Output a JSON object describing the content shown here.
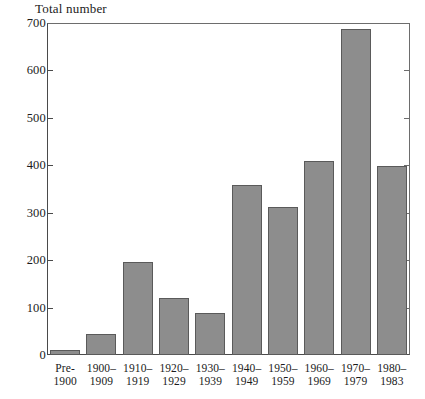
{
  "chart_data": {
    "type": "bar",
    "title": "Total number",
    "xlabel": "",
    "ylabel": "",
    "ylim": [
      0,
      700
    ],
    "yticks": [
      0,
      100,
      200,
      300,
      400,
      500,
      600,
      700
    ],
    "grid": false,
    "legend": null,
    "bar_color": "#8d8d8d",
    "bar_edge_color": "#5a5a5a",
    "axis_color": "#4a4a4a",
    "background": "#ffffff",
    "categories": [
      "Pre-1900",
      "1900–1909",
      "1910–1919",
      "1920–1929",
      "1930–1939",
      "1940–1949",
      "1950–1959",
      "1960–1969",
      "1970–1979",
      "1980–1983"
    ],
    "category_lines": [
      {
        "line1": "Pre-",
        "line2": "1900"
      },
      {
        "line1": "1900–",
        "line2": "1909"
      },
      {
        "line1": "1910–",
        "line2": "1919"
      },
      {
        "line1": "1920–",
        "line2": "1929"
      },
      {
        "line1": "1930–",
        "line2": "1939"
      },
      {
        "line1": "1940–",
        "line2": "1949"
      },
      {
        "line1": "1950–",
        "line2": "1959"
      },
      {
        "line1": "1960–",
        "line2": "1969"
      },
      {
        "line1": "1970–",
        "line2": "1979"
      },
      {
        "line1": "1980–",
        "line2": "1983"
      }
    ],
    "values": [
      10,
      44,
      197,
      120,
      88,
      359,
      313,
      410,
      688,
      399
    ]
  },
  "axis": {
    "ticks": [
      {
        "label": "700",
        "value": 700
      },
      {
        "label": "600",
        "value": 600
      },
      {
        "label": "500",
        "value": 500
      },
      {
        "label": "400",
        "value": 400
      },
      {
        "label": "300",
        "value": 300
      },
      {
        "label": "200",
        "value": 200
      },
      {
        "label": "100",
        "value": 100
      },
      {
        "label": "0",
        "value": 0
      }
    ]
  }
}
